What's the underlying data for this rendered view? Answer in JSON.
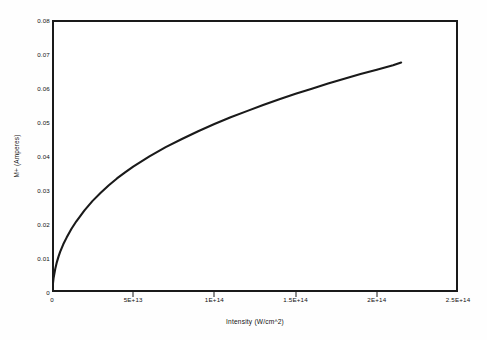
{
  "figure": {
    "background_color": "#ffffff",
    "frame_color": "#1a1a1a",
    "curve_color": "#1a1a1a"
  },
  "chart_data": {
    "type": "line",
    "title": "",
    "subtitle": "",
    "xlabel": "Intensity (W/cm^2)",
    "ylabel": "M+ (Amperes)",
    "xlim": [
      0,
      250000000000000
    ],
    "ylim": [
      0,
      0.08
    ],
    "grid": false,
    "legend": null,
    "xticks": [
      0,
      50000000000000,
      100000000000000,
      150000000000000,
      200000000000000,
      250000000000000
    ],
    "xticklabels": [
      "0",
      "5E+13",
      "1E+14",
      "1.5E+14",
      "2E+14",
      "2.5E+14"
    ],
    "yticks": [
      0,
      0.01,
      0.02,
      0.03,
      0.04,
      0.05,
      0.06,
      0.07,
      0.08
    ],
    "yticklabels": [
      "0",
      "0.01",
      "0.02",
      "0.03",
      "0.04",
      "0.05",
      "0.06",
      "0.07",
      "0.08"
    ],
    "series": [
      {
        "name": "M+ signal",
        "x": [
          0,
          1000000000000,
          2000000000000,
          3000000000000,
          4000000000000,
          5000000000000,
          7000000000000,
          9000000000000,
          12000000000000,
          15000000000000,
          20000000000000,
          25000000000000,
          30000000000000,
          35000000000000,
          40000000000000,
          45000000000000,
          50000000000000,
          60000000000000,
          70000000000000,
          80000000000000,
          90000000000000,
          100000000000000,
          110000000000000,
          120000000000000,
          130000000000000,
          140000000000000,
          150000000000000,
          160000000000000,
          170000000000000,
          180000000000000,
          190000000000000,
          200000000000000,
          210000000000000,
          215000000000000
        ],
        "y": [
          0.0,
          0.0042,
          0.0068,
          0.0088,
          0.0104,
          0.0118,
          0.0141,
          0.016,
          0.0186,
          0.0208,
          0.024,
          0.0268,
          0.0292,
          0.0314,
          0.0334,
          0.0352,
          0.0369,
          0.0399,
          0.0426,
          0.045,
          0.0473,
          0.0494,
          0.0514,
          0.0532,
          0.055,
          0.0567,
          0.0583,
          0.0598,
          0.0613,
          0.0627,
          0.0641,
          0.0654,
          0.0667,
          0.0675
        ]
      }
    ],
    "annotations": []
  },
  "axes": {
    "y_title": "M+ (Amperes)",
    "x_title": "Intensity (W/cm^2)"
  }
}
